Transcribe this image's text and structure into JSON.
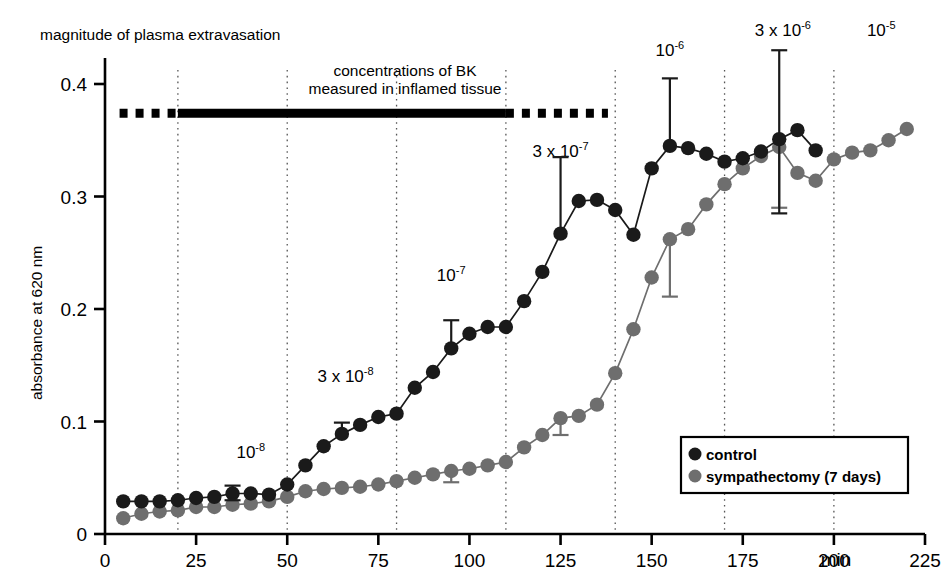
{
  "figure": {
    "title": "magnitude of plasma extravasation",
    "y_axis_label": "absorbance at 620 nm",
    "x_axis_unit": "min"
  },
  "bar_annotation": {
    "line1": "concentrations of BK",
    "line2": "measured in inflamed tissue",
    "dash_start_min": 4,
    "solid_start_min": 20,
    "solid_end_min": 110,
    "dash_end_min": 138,
    "y_value": 0.374
  },
  "legend": {
    "items": [
      {
        "label": "control",
        "color": "#1a1a1a"
      },
      {
        "label": "sympathectomy (7 days)",
        "color": "#6e6e6e"
      }
    ]
  },
  "concentration_labels": [
    {
      "text": "10",
      "exponent": "-8",
      "x_min": 40,
      "y_value": 0.068
    },
    {
      "text": "3 x 10",
      "exponent": "-8",
      "x_min": 66,
      "y_value": 0.135
    },
    {
      "text": "10",
      "exponent": "-7",
      "x_min": 95,
      "y_value": 0.225
    },
    {
      "text": "3 x 10",
      "exponent": "-7",
      "x_min": 125,
      "y_value": 0.335
    },
    {
      "text": "10",
      "exponent": "-6",
      "x_min": 155,
      "y_value": 0.425
    },
    {
      "text": "3 x 10",
      "exponent": "-6",
      "x_min": 186,
      "y_value": 0.443
    },
    {
      "text": "10",
      "exponent": "-5",
      "x_min": 213,
      "y_value": 0.443
    }
  ],
  "chart_data": {
    "type": "line",
    "title": "magnitude of plasma extravasation",
    "xlabel": "min",
    "ylabel": "absorbance at 620 nm",
    "xlim": [
      0,
      225
    ],
    "ylim": [
      0,
      0.43
    ],
    "xticks": [
      0,
      25,
      50,
      75,
      100,
      125,
      150,
      175,
      200,
      225
    ],
    "yticks": [
      0,
      0.1,
      0.2,
      0.3,
      0.4
    ],
    "ytick_labels": [
      "0",
      "0.1",
      "0.2",
      "0.3",
      "0.4"
    ],
    "grid": "vertical-dotted",
    "gridlines_x": [
      20,
      50,
      80,
      110,
      140,
      170,
      200
    ],
    "legend_position": "bottom-right",
    "series": [
      {
        "name": "control",
        "color": "#1a1a1a",
        "x": [
          5,
          10,
          15,
          20,
          25,
          30,
          35,
          40,
          45,
          50,
          55,
          60,
          65,
          70,
          75,
          80,
          85,
          90,
          95,
          100,
          105,
          110,
          115,
          120,
          125,
          130,
          135,
          140,
          145,
          150,
          155,
          160,
          165,
          170,
          175,
          180,
          185,
          190,
          195
        ],
        "values": [
          0.029,
          0.029,
          0.029,
          0.03,
          0.032,
          0.033,
          0.036,
          0.036,
          0.035,
          0.044,
          0.061,
          0.078,
          0.089,
          0.097,
          0.104,
          0.107,
          0.13,
          0.144,
          0.165,
          0.178,
          0.184,
          0.184,
          0.207,
          0.233,
          0.267,
          0.296,
          0.297,
          0.288,
          0.266,
          0.325,
          0.345,
          0.343,
          0.338,
          0.331,
          0.334,
          0.34,
          0.351,
          0.359,
          0.341
        ],
        "errors": [
          {
            "x": 35,
            "y": 0.036,
            "upper": 0.043,
            "lower": 0.03
          },
          {
            "x": 65,
            "y": 0.089,
            "upper": 0.099,
            "lower": 0.089
          },
          {
            "x": 95,
            "y": 0.165,
            "upper": 0.19,
            "lower": 0.165
          },
          {
            "x": 125,
            "y": 0.267,
            "upper": 0.335,
            "lower": 0.267
          },
          {
            "x": 155,
            "y": 0.345,
            "upper": 0.405,
            "lower": 0.345
          },
          {
            "x": 185,
            "y": 0.351,
            "upper": 0.43,
            "lower": 0.285
          }
        ]
      },
      {
        "name": "sympathectomy (7 days)",
        "color": "#6e6e6e",
        "x": [
          5,
          10,
          15,
          20,
          25,
          30,
          35,
          40,
          45,
          50,
          55,
          60,
          65,
          70,
          75,
          80,
          85,
          90,
          95,
          100,
          105,
          110,
          115,
          120,
          125,
          130,
          135,
          140,
          145,
          150,
          155,
          160,
          165,
          170,
          175,
          180,
          185,
          190,
          195,
          200,
          205,
          210,
          215,
          220
        ],
        "values": [
          0.014,
          0.018,
          0.02,
          0.021,
          0.024,
          0.024,
          0.026,
          0.027,
          0.029,
          0.033,
          0.038,
          0.04,
          0.041,
          0.042,
          0.044,
          0.047,
          0.05,
          0.053,
          0.056,
          0.058,
          0.061,
          0.064,
          0.077,
          0.088,
          0.103,
          0.105,
          0.115,
          0.143,
          0.182,
          0.228,
          0.262,
          0.271,
          0.293,
          0.311,
          0.325,
          0.336,
          0.344,
          0.321,
          0.314,
          0.333,
          0.339,
          0.341,
          0.35,
          0.36
        ],
        "errors": [
          {
            "x": 95,
            "y": 0.056,
            "upper": 0.056,
            "lower": 0.046
          },
          {
            "x": 125,
            "y": 0.103,
            "upper": 0.103,
            "lower": 0.088
          },
          {
            "x": 155,
            "y": 0.262,
            "upper": 0.262,
            "lower": 0.211
          },
          {
            "x": 185,
            "y": 0.344,
            "upper": 0.344,
            "lower": 0.29
          }
        ]
      }
    ]
  }
}
